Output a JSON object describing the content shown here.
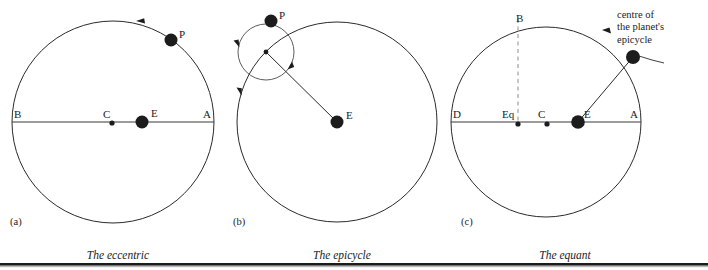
{
  "figure": {
    "title_ghost_strip": "",
    "background_color": "#ffffff",
    "ink_color": "#1c1c1c",
    "dashed_color": "#9a9a9a"
  },
  "panels": [
    {
      "letter": "(a)",
      "caption": "The eccentric",
      "deferent": {
        "cx": 113,
        "cy": 122,
        "r": 101
      },
      "axis": {
        "x1": 12,
        "y1": 122,
        "x2": 214,
        "y2": 122
      },
      "points": [
        {
          "name": "B",
          "label": "B",
          "x": 12,
          "y": 122,
          "kind": "none",
          "label_dx": 2,
          "label_dy": -13
        },
        {
          "name": "C",
          "label": "C",
          "x": 112,
          "y": 123,
          "kind": "small",
          "label_dx": -9,
          "label_dy": -14
        },
        {
          "name": "E",
          "label": "E",
          "x": 142,
          "y": 122,
          "kind": "big",
          "label_dx": 9,
          "label_dy": -14
        },
        {
          "name": "A",
          "label": "A",
          "x": 214,
          "y": 122,
          "kind": "none",
          "label_dx": -11,
          "label_dy": -13
        },
        {
          "name": "P",
          "label": "P",
          "x": 171,
          "y": 40,
          "kind": "big",
          "label_dx": 8,
          "label_dy": -11
        }
      ],
      "arrows": [
        {
          "name": "deferent-direction",
          "x": 136,
          "y": 21,
          "angle": 196
        }
      ]
    },
    {
      "letter": "(b)",
      "caption": "The epicycle",
      "deferent": {
        "cx": 337,
        "cy": 122,
        "r": 100
      },
      "epicycle": {
        "cx": 266,
        "cy": 52,
        "r": 28
      },
      "points": [
        {
          "name": "P",
          "label": "P",
          "x": 271,
          "y": 21,
          "kind": "big",
          "label_dx": 8,
          "label_dy": -11
        },
        {
          "name": "epicycle-centre",
          "label": "",
          "x": 266,
          "y": 52,
          "kind": "small",
          "label_dx": 0,
          "label_dy": 0
        },
        {
          "name": "E",
          "label": "E",
          "x": 337,
          "y": 122,
          "kind": "big",
          "label_dx": 9,
          "label_dy": -12
        }
      ],
      "radius": {
        "x1": 337,
        "y1": 122,
        "x2": 266,
        "y2": 52
      },
      "arrows": [
        {
          "name": "epicycle-direction-left",
          "x": 236,
          "y": 44,
          "angle": 255
        },
        {
          "name": "epicycle-direction-right",
          "x": 290,
          "y": 66,
          "angle": 60
        },
        {
          "name": "deferent-direction",
          "x": 239,
          "y": 92,
          "angle": 250
        }
      ]
    },
    {
      "letter": "(c)",
      "caption": "The equant",
      "deferent": {
        "cx": 546,
        "cy": 122,
        "r": 95
      },
      "axis": {
        "x1": 451,
        "y1": 122,
        "x2": 641,
        "y2": 122
      },
      "dashed": {
        "x1": 518,
        "y1": 19,
        "x2": 518,
        "y2": 122
      },
      "points": [
        {
          "name": "D",
          "label": "D",
          "x": 451,
          "y": 122,
          "kind": "none",
          "label_dx": 2,
          "label_dy": -13
        },
        {
          "name": "Eq",
          "label": "Eq",
          "x": 518,
          "y": 124,
          "kind": "small",
          "label_dx": -16,
          "label_dy": -14
        },
        {
          "name": "C",
          "label": "C",
          "x": 547,
          "y": 124,
          "kind": "small",
          "label_dx": -9,
          "label_dy": -14
        },
        {
          "name": "E",
          "label": "E",
          "x": 578,
          "y": 122,
          "kind": "big",
          "label_dx": 7,
          "label_dy": -13
        },
        {
          "name": "A",
          "label": "A",
          "x": 641,
          "y": 122,
          "kind": "none",
          "label_dx": -11,
          "label_dy": -13
        },
        {
          "name": "B",
          "label": "B",
          "x": 521,
          "y": 27,
          "kind": "none",
          "label_dx": -3,
          "label_dy": -12
        },
        {
          "name": "epicycle-centre",
          "label": "",
          "x": 633,
          "y": 57,
          "kind": "big",
          "label_dx": 0,
          "label_dy": 0
        }
      ],
      "radius": {
        "x1": 578,
        "y1": 122,
        "x2": 633,
        "y2": 57
      },
      "arrows": [
        {
          "name": "deferent-direction",
          "x": 605,
          "y": 31,
          "angle": 200
        }
      ],
      "annotation": {
        "name": "epicycle-centre-callout",
        "lines": [
          "centre of",
          "the planet's",
          "epicycle"
        ],
        "x": 617,
        "y": 10,
        "leader": {
          "x1": 650,
          "y1": 53,
          "x2": 670,
          "y2": 62
        }
      }
    }
  ],
  "captions_row": {
    "y": 250,
    "items": [
      "The eccentric",
      "The epicycle",
      "The equant"
    ]
  },
  "rules": [
    {
      "name": "bottom-rule",
      "x": 0,
      "y": 263,
      "width": 708,
      "height": 3
    }
  ]
}
